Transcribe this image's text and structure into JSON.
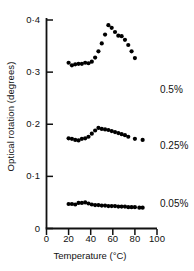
{
  "chart_data": {
    "type": "scatter",
    "title": "",
    "xlabel": "Temperature (°C)",
    "ylabel": "Optical rotation (degrees)",
    "xlim": [
      0,
      100
    ],
    "ylim": [
      0,
      0.42
    ],
    "grid": false,
    "legend_position": "right-inline",
    "xticks": [
      0,
      20,
      40,
      60,
      80,
      100
    ],
    "xtick_labels": [
      "0",
      "20",
      "40",
      "60",
      "80",
      "100"
    ],
    "yticks": [
      0,
      0.1,
      0.2,
      0.3,
      0.4
    ],
    "ytick_labels": [
      "0",
      "0·1",
      "0·2",
      "0·3",
      "0·4"
    ],
    "marker": "filled-circle",
    "marker_color": "#000000",
    "series": [
      {
        "name": "0.5%",
        "label": "0.5%",
        "x": [
          20,
          23,
          26,
          29,
          32,
          35,
          38,
          41,
          44,
          47,
          50,
          53,
          56,
          59,
          62,
          65,
          68,
          71,
          74,
          77,
          80
        ],
        "y": [
          0.318,
          0.313,
          0.315,
          0.316,
          0.316,
          0.318,
          0.317,
          0.32,
          0.328,
          0.34,
          0.355,
          0.372,
          0.39,
          0.385,
          0.377,
          0.37,
          0.369,
          0.362,
          0.352,
          0.34,
          0.327
        ]
      },
      {
        "name": "0.25%",
        "label": "0.25%",
        "x": [
          20,
          23,
          26,
          29,
          32,
          35,
          38,
          41,
          44,
          47,
          50,
          53,
          56,
          59,
          62,
          65,
          68,
          71,
          74,
          80,
          87
        ],
        "y": [
          0.173,
          0.172,
          0.17,
          0.169,
          0.172,
          0.173,
          0.176,
          0.182,
          0.188,
          0.193,
          0.191,
          0.19,
          0.189,
          0.187,
          0.185,
          0.183,
          0.181,
          0.179,
          0.176,
          0.172,
          0.17
        ]
      },
      {
        "name": "0.05%",
        "label": "0.05%",
        "x": [
          20,
          23,
          26,
          29,
          32,
          35,
          38,
          41,
          44,
          47,
          50,
          53,
          56,
          59,
          62,
          65,
          68,
          71,
          74,
          77,
          80,
          84,
          87
        ],
        "y": [
          0.047,
          0.047,
          0.046,
          0.049,
          0.049,
          0.05,
          0.048,
          0.046,
          0.045,
          0.045,
          0.044,
          0.044,
          0.043,
          0.043,
          0.043,
          0.042,
          0.042,
          0.042,
          0.041,
          0.041,
          0.041,
          0.04,
          0.04
        ]
      }
    ]
  },
  "axis_color": "#111111",
  "background_color": "#ffffff"
}
